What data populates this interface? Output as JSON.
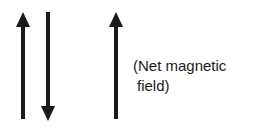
{
  "diagram": {
    "arrows": [
      {
        "name": "up-arrow-left",
        "direction": "up",
        "x": 23
      },
      {
        "name": "down-arrow",
        "direction": "down",
        "x": 48
      },
      {
        "name": "up-arrow-net",
        "direction": "up",
        "x": 116
      }
    ],
    "label": {
      "line1": "(Net magnetic",
      "line2": "field)"
    },
    "colors": {
      "arrow": "#1a1a1a",
      "background": "#ffffff"
    }
  }
}
